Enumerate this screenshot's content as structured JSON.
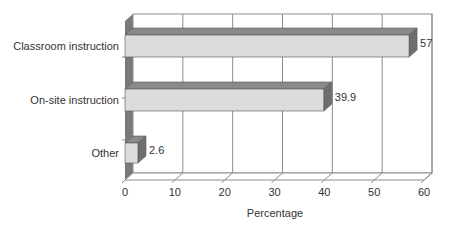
{
  "chart_data": {
    "type": "bar",
    "orientation": "horizontal",
    "style": "3d",
    "title": "",
    "categories": [
      "Classroom instruction",
      "On-site instruction",
      "Other"
    ],
    "values": [
      57,
      39.9,
      2.6
    ],
    "data_labels": [
      "57",
      "39.9",
      "2.6"
    ],
    "xlabel": "Percentage",
    "ylabel": "",
    "xlim": [
      0,
      60
    ],
    "xticks": [
      "0",
      "10",
      "20",
      "30",
      "40",
      "50",
      "60"
    ],
    "grid": "vertical",
    "legend": "none"
  },
  "colors": {
    "bar_front": "#dcdcdc",
    "bar_top": "#8a8a8a",
    "bar_side": "#6e6e6e",
    "left_wall": "#7a7a7a",
    "grid": "#8c8c8c",
    "text": "#333333"
  }
}
